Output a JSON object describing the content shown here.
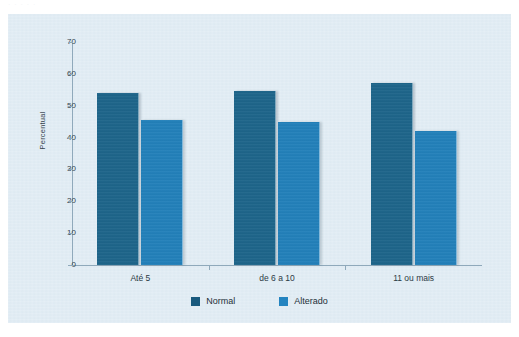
{
  "page": {
    "top_fragment_text": "·   ·   ·      ·   ·"
  },
  "chart_data": {
    "type": "bar",
    "title": "",
    "subtitle": "",
    "xlabel": "",
    "ylabel": "Percentual",
    "categories": [
      "Até 5",
      "de 6 a 10",
      "11 ou mais"
    ],
    "series": [
      {
        "name": "Normal",
        "color": "#1a6389",
        "values": [
          54,
          54.5,
          57
        ]
      },
      {
        "name": "Alterado",
        "color": "#1f7fba",
        "values": [
          45.6,
          44.8,
          42
        ]
      }
    ],
    "ylim": [
      0,
      70
    ],
    "yticks": [
      0,
      10,
      20,
      30,
      40,
      50,
      60,
      70
    ],
    "ytick_labels": [
      "0",
      "10",
      "20",
      "30",
      "40",
      "50",
      "60",
      "70"
    ],
    "grid": false,
    "legend_position": "bottom",
    "legend": [
      "Normal",
      "Alterado"
    ],
    "axis_color": "#8fa9bb",
    "plot_background": "#dce9f2"
  }
}
